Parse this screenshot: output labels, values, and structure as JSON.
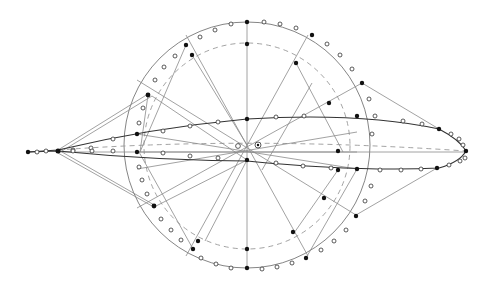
{
  "diagram": {
    "title": "",
    "center": [
      247,
      145
    ],
    "outer_circle_radius": 123,
    "inner_circle_radius": 103,
    "left_tip": [
      28,
      152
    ],
    "right_tip": [
      466,
      151
    ],
    "colors": {
      "line": "#8a8a8a",
      "curve": "#333333",
      "dashed": "#999999",
      "point_filled": "#111111",
      "point_open": "#ffffff"
    }
  }
}
